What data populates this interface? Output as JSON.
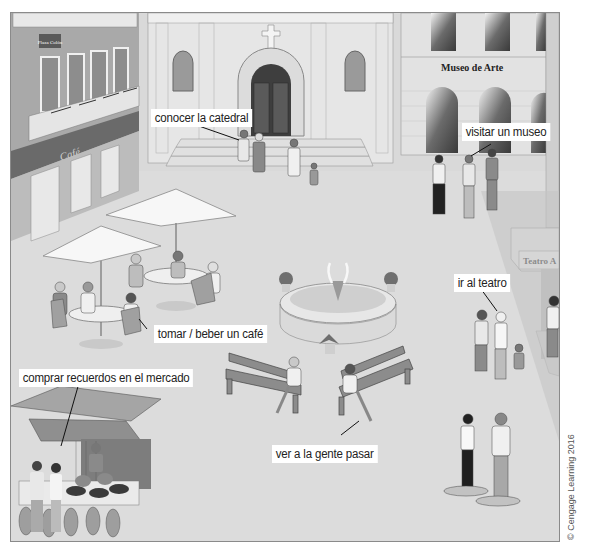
{
  "scene": {
    "description": "Illustrated town plaza with cathedral, art museum, café, theater, fountain, benches and market",
    "palette": {
      "frame_border": "#8a8a8a",
      "plaza_ground": "#d9d9d9",
      "building_light": "#e6e6e6",
      "building_mid": "#bdbdbd",
      "building_dark": "#6e6e6e",
      "label_bg": "#ffffff",
      "label_text": "#222222"
    }
  },
  "signs": {
    "small_building_sign": "Plaza Colón",
    "museum": "Museo de Arte",
    "theater": "Teatro A",
    "cafe_awning": "Café"
  },
  "labels": [
    {
      "id": "cathedral",
      "text": "conocer la catedral"
    },
    {
      "id": "museum",
      "text": "visitar un museo"
    },
    {
      "id": "cafe",
      "text": "tomar / beber un café"
    },
    {
      "id": "theater",
      "text": "ir al teatro"
    },
    {
      "id": "market",
      "text": "comprar recuerdos en el mercado"
    },
    {
      "id": "people",
      "text": "ver a la gente pasar"
    }
  ],
  "credit": "© Cengage Learning 2016"
}
